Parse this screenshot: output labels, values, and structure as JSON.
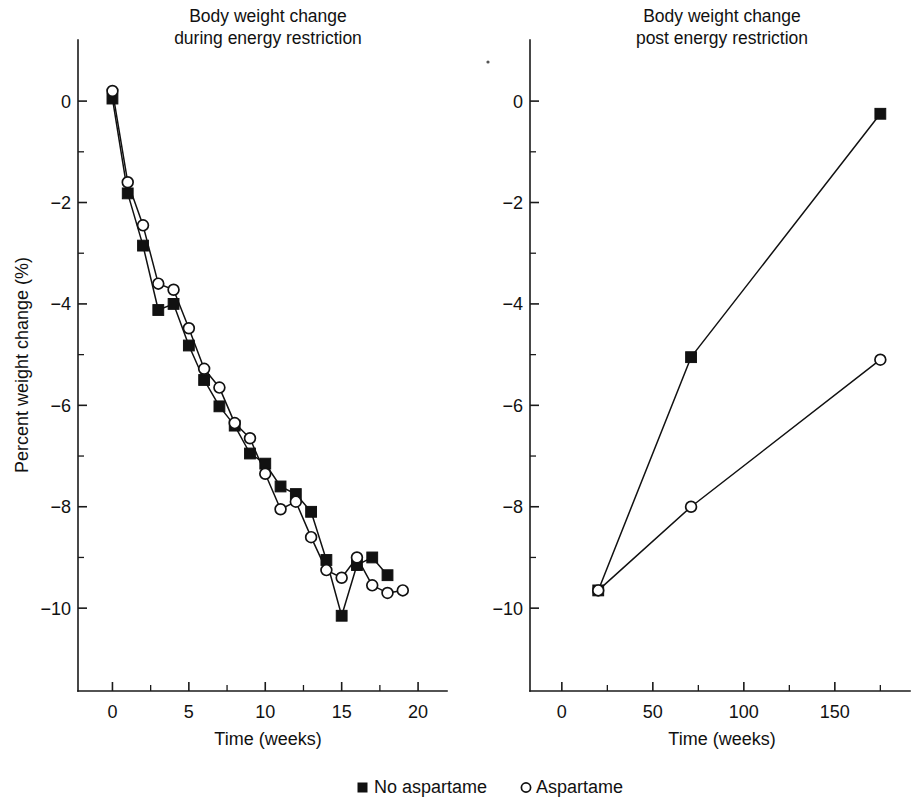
{
  "figure": {
    "y_axis_title": "Percent weight change (%)",
    "speck_artifact": "scan-speck"
  },
  "legend": {
    "entries": [
      {
        "label": "No aspartame",
        "marker": "filled-square",
        "color": "#111111"
      },
      {
        "label": "Aspartame",
        "marker": "open-circle",
        "color": "#111111"
      }
    ]
  },
  "chart_data": [
    {
      "type": "line",
      "panel": "left",
      "title": "Body weight change\nduring energy restriction",
      "title_line1": "Body weight change",
      "title_line2": "during energy restriction",
      "xlabel": "Time (weeks)",
      "ylabel": "Percent weight change (%)",
      "xlim": [
        -1.6,
        21.5
      ],
      "ylim": [
        -11.2,
        0.85
      ],
      "xticks": [
        0,
        5,
        10,
        15,
        20
      ],
      "xtick_labels": [
        "0",
        "5",
        "10",
        "15",
        "20"
      ],
      "xminor": [
        2.5,
        7.5,
        12.5,
        17.5
      ],
      "yticks": [
        0,
        -2,
        -4,
        -6,
        -8,
        -10
      ],
      "ytick_labels": [
        "0",
        "−2",
        "−4",
        "−6",
        "−8",
        "−10"
      ],
      "yminor": [
        -1,
        -3,
        -5,
        -7,
        -9
      ],
      "grid": false,
      "legend_position": "below-figure",
      "series": [
        {
          "name": "No aspartame",
          "marker": "filled-square",
          "x": [
            0,
            1,
            2,
            3,
            4,
            5,
            6,
            7,
            8,
            9,
            10,
            11,
            12,
            13,
            14,
            15,
            16,
            17,
            18
          ],
          "values": [
            0.05,
            -1.82,
            -2.85,
            -4.12,
            -4.0,
            -4.82,
            -5.5,
            -6.02,
            -6.4,
            -6.95,
            -7.15,
            -7.6,
            -7.75,
            -8.1,
            -9.05,
            -10.15,
            -9.15,
            -9.0,
            -9.35
          ]
        },
        {
          "name": "Aspartame",
          "marker": "open-circle",
          "x": [
            0,
            1,
            2,
            3,
            4,
            5,
            6,
            7,
            8,
            9,
            10,
            11,
            12,
            13,
            14,
            15,
            16,
            17,
            18,
            19
          ],
          "values": [
            0.2,
            -1.6,
            -2.45,
            -3.6,
            -3.72,
            -4.48,
            -5.28,
            -5.65,
            -6.35,
            -6.65,
            -7.35,
            -8.05,
            -7.9,
            -8.6,
            -9.25,
            -9.4,
            -9.0,
            -9.55,
            -9.7,
            -9.65
          ]
        }
      ]
    },
    {
      "type": "line",
      "panel": "right",
      "title": "Body weight change\npost energy restriction",
      "title_line1": "Body weight change",
      "title_line2": "post energy restriction",
      "xlabel": "Time (weeks)",
      "ylabel": "Percent weight change (%)",
      "xlim": [
        -12,
        188
      ],
      "ylim": [
        -11.2,
        0.85
      ],
      "xticks": [
        0,
        50,
        100,
        150
      ],
      "xtick_labels": [
        "0",
        "50",
        "100",
        "150"
      ],
      "xminor": [
        25,
        75,
        125,
        175
      ],
      "yticks": [
        0,
        -2,
        -4,
        -6,
        -8,
        -10
      ],
      "ytick_labels": [
        "0",
        "−2",
        "−4",
        "−6",
        "−8",
        "−10"
      ],
      "yminor": [
        -1,
        -3,
        -5,
        -7,
        -9
      ],
      "grid": false,
      "legend_position": "below-figure",
      "series": [
        {
          "name": "No aspartame",
          "marker": "filled-square",
          "x": [
            20,
            71,
            175
          ],
          "values": [
            -9.65,
            -5.05,
            -0.25
          ]
        },
        {
          "name": "Aspartame",
          "marker": "open-circle",
          "x": [
            20,
            71,
            175
          ],
          "values": [
            -9.65,
            -8.0,
            -5.1
          ]
        }
      ]
    }
  ]
}
